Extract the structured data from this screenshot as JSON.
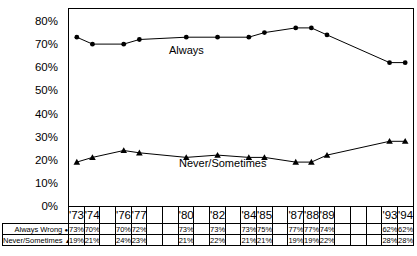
{
  "chart_data": {
    "type": "line",
    "title": "",
    "xlabel": "",
    "ylabel": "",
    "grid": false,
    "colors": {
      "line": "#000000",
      "background": "#ffffff",
      "text": "#000000"
    },
    "categories": [
      "'73",
      "'74",
      "",
      "'76",
      "'77",
      "",
      "",
      "'80",
      "",
      "'82",
      "",
      "'84",
      "'85",
      "",
      "'87",
      "'88",
      "'89",
      "",
      "",
      "",
      "'93",
      "'94"
    ],
    "series": [
      {
        "name": "Always Wrong",
        "marker": "circle",
        "marker_glyph": "●",
        "chart_label": "Always",
        "values": [
          73,
          70,
          null,
          70,
          72,
          null,
          null,
          73,
          null,
          73,
          null,
          73,
          75,
          null,
          77,
          77,
          74,
          null,
          null,
          null,
          62,
          62
        ]
      },
      {
        "name": "Never/Sometimes",
        "marker": "triangle",
        "marker_glyph": "▲",
        "chart_label": "Never/Sometimes",
        "values": [
          19,
          21,
          null,
          24,
          23,
          null,
          null,
          21,
          null,
          22,
          null,
          21,
          21,
          null,
          19,
          19,
          22,
          null,
          null,
          null,
          28,
          28
        ]
      }
    ],
    "y_axis": {
      "tick_values": [
        80,
        70,
        60,
        50,
        40,
        30,
        20,
        10,
        0
      ],
      "tick_labels": [
        "80%",
        "70%",
        "60%",
        "50%",
        "40%",
        "30%",
        "20%",
        "10%",
        "0%"
      ],
      "ylim": [
        0,
        85
      ]
    }
  },
  "table": {
    "rows": [
      {
        "label": "Always Wrong",
        "marker_glyph": "●",
        "cells": [
          "73%",
          "70%",
          "",
          "70%",
          "72%",
          "",
          "",
          "73%",
          "",
          "73%",
          "",
          "73%",
          "75%",
          "",
          "77%",
          "77%",
          "74%",
          "",
          "",
          "",
          "62%",
          "62%"
        ]
      },
      {
        "label": "Never/Sometimes",
        "marker_glyph": "▲",
        "cells": [
          "19%",
          "21%",
          "",
          "24%",
          "23%",
          "",
          "",
          "21%",
          "",
          "22%",
          "",
          "21%",
          "21%",
          "",
          "19%",
          "19%",
          "22%",
          "",
          "",
          "",
          "28%",
          "28%"
        ]
      }
    ]
  }
}
